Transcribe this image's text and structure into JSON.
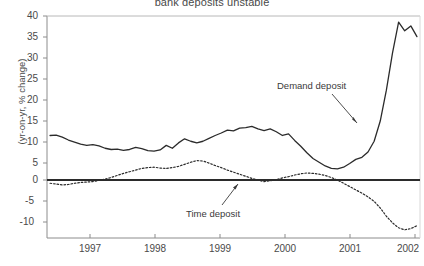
{
  "chart": {
    "title": "bank deposits unstable",
    "ylabel": "(yr-on-yr, % change)",
    "xlabel": "",
    "annotations": {
      "demand": "Demand deposit",
      "time": "Time deposit"
    },
    "colors": {
      "demand_line": "#2b2b2b",
      "time_line": "#2b2b2b",
      "axis": "#8c8c8c",
      "zero_line": "#2b2b2b",
      "text": "#4a4a4a",
      "background": "#ffffff"
    }
  },
  "chart_data": {
    "type": "line",
    "title": "bank deposits unstable",
    "xlabel": "",
    "ylabel": "(yr-on-yr, % change)",
    "xlim": [
      1996.5,
      2002.6
    ],
    "ylim": [
      -13.5,
      40
    ],
    "grid": false,
    "legend": "annotations-inline",
    "yticks": [
      40,
      35,
      30,
      25,
      20,
      15,
      10,
      5,
      0,
      -5,
      -10
    ],
    "ytick_labels": [
      "40",
      "35",
      "30",
      "25",
      "20",
      "15",
      "10",
      "5",
      "0",
      "-5",
      "-10"
    ],
    "xticks": [
      1997,
      1998,
      1999,
      2000,
      2001,
      2002
    ],
    "xtick_labels": [
      "1997",
      "1998",
      "1999",
      "2000",
      "2001",
      "2002"
    ],
    "zero_reference_line": 0,
    "series": [
      {
        "name": "Demand deposit",
        "style": "solid",
        "x": [
          1996.55,
          1996.65,
          1996.75,
          1996.85,
          1996.95,
          1997.05,
          1997.15,
          1997.25,
          1997.35,
          1997.45,
          1997.55,
          1997.65,
          1997.75,
          1997.85,
          1997.95,
          1998.05,
          1998.15,
          1998.25,
          1998.35,
          1998.45,
          1998.55,
          1998.65,
          1998.75,
          1998.85,
          1998.95,
          1999.05,
          1999.15,
          1999.25,
          1999.35,
          1999.45,
          1999.55,
          1999.65,
          1999.75,
          1999.85,
          1999.95,
          2000.05,
          2000.15,
          2000.25,
          2000.35,
          2000.45,
          2000.55,
          2000.65,
          2000.75,
          2000.85,
          2000.95,
          2001.05,
          2001.15,
          2001.25,
          2001.35,
          2001.45,
          2001.55,
          2001.65,
          2001.75,
          2001.85,
          2001.95,
          2002.05,
          2002.15,
          2002.25,
          2002.35,
          2002.45,
          2002.55
        ],
        "y": [
          11.0,
          11.1,
          10.6,
          9.9,
          9.4,
          8.9,
          8.6,
          8.8,
          8.5,
          7.9,
          7.6,
          7.7,
          7.4,
          7.6,
          8.1,
          7.8,
          7.3,
          7.2,
          7.5,
          8.6,
          7.9,
          9.2,
          10.2,
          9.6,
          9.2,
          9.6,
          10.3,
          11.0,
          11.6,
          12.3,
          12.1,
          12.8,
          12.9,
          13.2,
          12.6,
          12.2,
          12.6,
          11.9,
          11.0,
          11.4,
          9.8,
          8.4,
          6.8,
          5.4,
          4.5,
          3.6,
          3.0,
          2.9,
          3.3,
          4.2,
          5.2,
          5.7,
          7.0,
          9.6,
          14.5,
          22.0,
          31.0,
          38.5,
          36.4,
          37.6,
          35.0
        ],
        "annotation": "Demand deposit"
      },
      {
        "name": "Time deposit",
        "style": "dotted",
        "x": [
          1996.55,
          1996.65,
          1996.75,
          1996.85,
          1996.95,
          1997.05,
          1997.15,
          1997.25,
          1997.35,
          1997.45,
          1997.55,
          1997.65,
          1997.75,
          1997.85,
          1997.95,
          1998.05,
          1998.15,
          1998.25,
          1998.35,
          1998.45,
          1998.55,
          1998.65,
          1998.75,
          1998.85,
          1998.95,
          1999.05,
          1999.15,
          1999.25,
          1999.35,
          1999.45,
          1999.55,
          1999.65,
          1999.75,
          1999.85,
          1999.95,
          2000.05,
          2000.15,
          2000.25,
          2000.35,
          2000.45,
          2000.55,
          2000.65,
          2000.75,
          2000.85,
          2000.95,
          2001.05,
          2001.15,
          2001.25,
          2001.35,
          2001.45,
          2001.55,
          2001.65,
          2001.75,
          2001.85,
          2001.95,
          2002.05,
          2002.15,
          2002.25,
          2002.35,
          2002.45,
          2002.55
        ],
        "y": [
          -0.6,
          -0.8,
          -1.0,
          -0.9,
          -0.6,
          -0.4,
          -0.3,
          -0.2,
          0.1,
          0.4,
          0.8,
          1.3,
          1.8,
          2.2,
          2.6,
          3.0,
          3.2,
          3.3,
          3.1,
          3.0,
          3.2,
          3.5,
          4.0,
          4.5,
          4.9,
          4.8,
          4.3,
          3.7,
          3.2,
          2.6,
          2.1,
          1.6,
          1.1,
          0.6,
          0.2,
          -0.2,
          0.0,
          0.3,
          0.7,
          1.0,
          1.4,
          1.7,
          1.9,
          1.8,
          1.6,
          1.3,
          0.8,
          0.2,
          -0.6,
          -1.4,
          -2.2,
          -3.0,
          -3.9,
          -5.0,
          -6.6,
          -8.6,
          -10.2,
          -11.4,
          -11.9,
          -11.6,
          -10.9
        ],
        "annotation": "Time deposit"
      }
    ]
  }
}
